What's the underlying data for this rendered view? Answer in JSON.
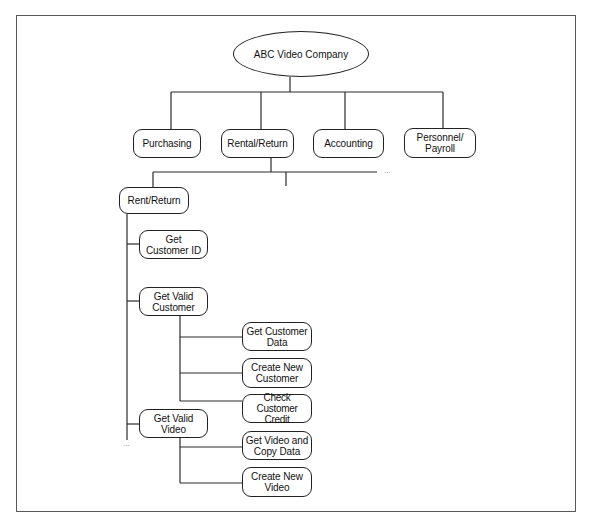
{
  "diagram": {
    "type": "hierarchy chart",
    "root": {
      "label": "ABC Video Company"
    },
    "level1": [
      {
        "id": "purchasing",
        "label": "Purchasing"
      },
      {
        "id": "rental-return",
        "label": "Rental/Return"
      },
      {
        "id": "accounting",
        "label": "Accounting"
      },
      {
        "id": "personnel-payroll",
        "label": "Personnel/\nPayroll"
      }
    ],
    "rental_return_children": {
      "ellipsis": "...",
      "rent_return": {
        "label": "Rent/Return",
        "ellipsis": "...",
        "children": [
          {
            "id": "get-customer-id",
            "label": "Get\nCustomer ID"
          },
          {
            "id": "get-valid-customer",
            "label": "Get Valid\nCustomer",
            "children": [
              {
                "id": "get-customer-data",
                "label": "Get Customer\nData"
              },
              {
                "id": "create-new-customer",
                "label": "Create New\nCustomer"
              },
              {
                "id": "check-customer-credit",
                "label": "Check Customer\nCredit"
              }
            ]
          },
          {
            "id": "get-valid-video",
            "label": "Get Valid\nVideo",
            "children": [
              {
                "id": "get-video-and-copy-data",
                "label": "Get Video and\nCopy Data"
              },
              {
                "id": "create-new-video",
                "label": "Create New\nVideo"
              }
            ]
          }
        ]
      }
    }
  }
}
